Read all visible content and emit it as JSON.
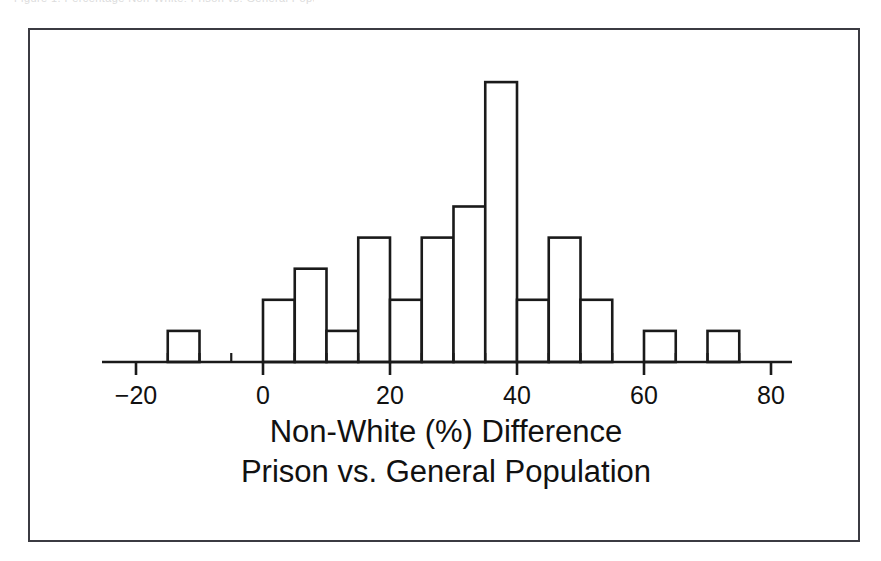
{
  "figure": {
    "top_caption": "Figure 1. Percentage Non-White: Prison vs. General Population",
    "frame_color": "#3b3b42",
    "ink_color": "#1a1a1a",
    "background": "#ffffff"
  },
  "chart_data": {
    "type": "bar",
    "subtype": "histogram",
    "title": "",
    "xlabel_line1": "Non-White (%) Difference",
    "xlabel_line2": "Prison vs. General Population",
    "ylabel": "",
    "grid": false,
    "legend": null,
    "bin_width": 5,
    "xlim": [
      -25,
      85
    ],
    "ylim": [
      0,
      9
    ],
    "x_major_ticks": [
      -20,
      0,
      20,
      40,
      60,
      80
    ],
    "x_major_tick_labels": [
      "−20",
      "0",
      "20",
      "40",
      "60",
      "80"
    ],
    "x_minor_ticks": [
      -15,
      -10,
      -5,
      5,
      10,
      15,
      25,
      30,
      35,
      45,
      50,
      55,
      65,
      70,
      75
    ],
    "bins": [
      {
        "start": -15,
        "end": -10,
        "count": 1
      },
      {
        "start": -10,
        "end": -5,
        "count": 0
      },
      {
        "start": -5,
        "end": 0,
        "count": 0
      },
      {
        "start": 0,
        "end": 5,
        "count": 2
      },
      {
        "start": 5,
        "end": 10,
        "count": 3
      },
      {
        "start": 10,
        "end": 15,
        "count": 1
      },
      {
        "start": 15,
        "end": 20,
        "count": 4
      },
      {
        "start": 20,
        "end": 25,
        "count": 2
      },
      {
        "start": 25,
        "end": 30,
        "count": 4
      },
      {
        "start": 30,
        "end": 35,
        "count": 5
      },
      {
        "start": 35,
        "end": 40,
        "count": 9
      },
      {
        "start": 40,
        "end": 45,
        "count": 2
      },
      {
        "start": 45,
        "end": 50,
        "count": 4
      },
      {
        "start": 50,
        "end": 55,
        "count": 2
      },
      {
        "start": 55,
        "end": 60,
        "count": 0
      },
      {
        "start": 60,
        "end": 65,
        "count": 1
      },
      {
        "start": 65,
        "end": 70,
        "count": 0
      },
      {
        "start": 70,
        "end": 75,
        "count": 1
      }
    ],
    "categories": [
      "-15",
      "-10",
      "-5",
      "0",
      "5",
      "10",
      "15",
      "20",
      "25",
      "30",
      "35",
      "40",
      "45",
      "50",
      "55",
      "60",
      "65",
      "70"
    ],
    "values": [
      1,
      0,
      0,
      2,
      3,
      1,
      4,
      2,
      4,
      5,
      9,
      2,
      4,
      2,
      0,
      1,
      0,
      1
    ]
  }
}
